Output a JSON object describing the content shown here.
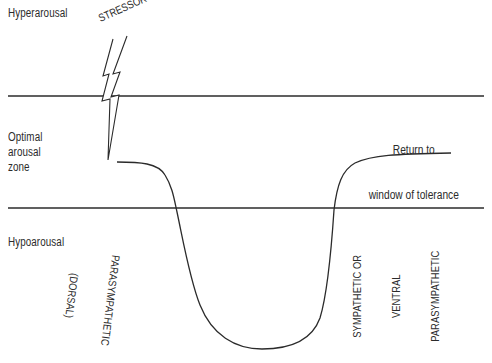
{
  "diagram": {
    "title": "Window of tolerance",
    "zones": {
      "top": "Hyperarousal",
      "middle": [
        "Optimal",
        "arousal",
        "zone"
      ],
      "bottom": "Hypoarousal"
    },
    "stressor_label": "STRESSOR",
    "return_label": [
      "Return to",
      "window of tolerance"
    ],
    "descent_label": [
      "PARASYMPATHETIC",
      "(DORSAL)"
    ],
    "ascent_label": [
      "SYMPATHETIC OR",
      "VENTRAL",
      "PARASYMPATHETIC"
    ],
    "colors": {
      "ink": "#2b2b2b",
      "background": "#ffffff"
    },
    "boundaries": {
      "upper_line_y": 96,
      "lower_line_y": 208
    }
  }
}
